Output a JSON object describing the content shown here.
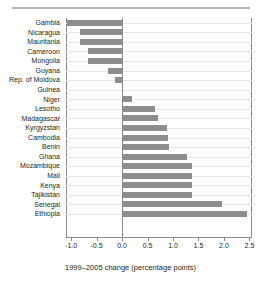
{
  "chart_data": {
    "type": "bar",
    "orientation": "horizontal",
    "title": "",
    "subtitle": "",
    "xlabel": "1999–2005 change (percentage points)",
    "ylabel": "",
    "xlim": [
      -1.1,
      2.55
    ],
    "xticks": [
      -1.0,
      -0.5,
      0.0,
      0.5,
      1.0,
      1.5,
      2.0,
      2.5
    ],
    "xticklabels": [
      "-1.0",
      "-0.5",
      "0.0",
      "0.5",
      "1.0",
      "1.5",
      "2.0",
      "2.5"
    ],
    "grid": "horizontal-light",
    "legend": "none",
    "bar_color": "#8d8d8d",
    "categories": [
      "Gambia",
      "Nicaragua",
      "Mauritania",
      "Cameroon",
      "Mongolia",
      "Guyana",
      "Rep. of Moldova",
      "Guinea",
      "Niger",
      "Lesotho",
      "Madagascar",
      "Kyrgyzstan",
      "Cambodia",
      "Benin",
      "Ghana",
      "Mozambique",
      "Mali",
      "Kenya",
      "Tajikistan",
      "Senegal",
      "Ethiopia"
    ],
    "values": [
      -1.08,
      -0.82,
      -0.82,
      -0.66,
      -0.66,
      -0.27,
      -0.13,
      0.0,
      0.2,
      0.65,
      0.7,
      0.88,
      0.9,
      0.92,
      1.27,
      1.37,
      1.38,
      1.38,
      1.38,
      1.97,
      2.45
    ]
  },
  "axis": {
    "title": "1999–2005 change (percentage points)"
  }
}
